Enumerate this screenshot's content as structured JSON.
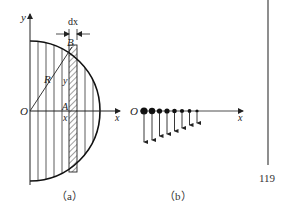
{
  "figure_a": {
    "caption": "（a）",
    "labels": {
      "y_axis": "y",
      "x_axis": "x",
      "origin": "O",
      "point_B": "B",
      "point_A": "A",
      "radius": "R",
      "height": "y",
      "position": "x",
      "width": "dx"
    }
  },
  "figure_b": {
    "caption": "（b）",
    "labels": {
      "origin": "O",
      "x_axis": "x"
    },
    "point_count": 8
  },
  "page_number": "119"
}
